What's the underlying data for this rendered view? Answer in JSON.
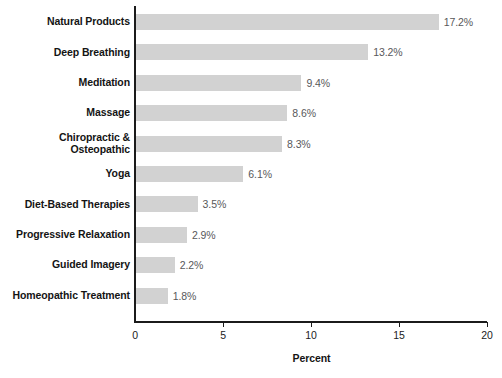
{
  "chart_data": {
    "type": "bar",
    "orientation": "horizontal",
    "title": "",
    "xlabel": "Percent",
    "ylabel": "",
    "xlim": [
      0,
      20
    ],
    "xticks": [
      "0",
      "5",
      "10",
      "15",
      "20"
    ],
    "grid": false,
    "legend": null,
    "bar_color": "#d2d2d2",
    "categories": [
      "Natural Products",
      "Deep Breathing",
      "Meditation",
      "Massage",
      "Chiropractic &\nOsteopathic",
      "Yoga",
      "Diet-Based Therapies",
      "Progressive Relaxation",
      "Guided Imagery",
      "Homeopathic Treatment"
    ],
    "values": [
      17.2,
      13.2,
      9.4,
      8.6,
      8.3,
      6.1,
      3.5,
      2.9,
      2.2,
      1.8
    ],
    "value_labels": [
      "17.2%",
      "13.2%",
      "9.4%",
      "8.6%",
      "8.3%",
      "6.1%",
      "3.5%",
      "2.9%",
      "2.2%",
      "1.8%"
    ]
  }
}
